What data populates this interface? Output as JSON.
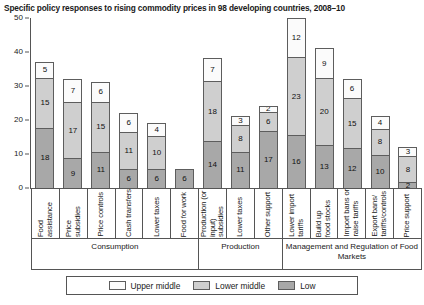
{
  "chart_data": {
    "type": "bar",
    "stacked": true,
    "title": "Specific policy responses to rising commodity prices in 98 developing countries, 2008–10",
    "xlabel": "",
    "ylabel": "",
    "ylim": [
      0,
      50
    ],
    "yticks": [
      0,
      10,
      20,
      30,
      40,
      50
    ],
    "grid": false,
    "legend_position": "bottom",
    "categories": [
      "Food assistance",
      "Price subsidies",
      "Price controls",
      "Cash transfers",
      "Lower taxes",
      "Food for work",
      "Production (or\ninput) subsidies",
      "Lower taxes",
      "Other support",
      "Lower import\ntariffs",
      "Build up\nfood stocks",
      "Import bans or\nraise tariffs",
      "Export bans/\ntariffs/controls",
      "Price support"
    ],
    "series": [
      {
        "name": "Low",
        "color": "#a8a8a8",
        "values": [
          18,
          9,
          11,
          6,
          6,
          6,
          14,
          11,
          17,
          16,
          13,
          12,
          10,
          2
        ]
      },
      {
        "name": "Lower middle",
        "color": "#cfcfcf",
        "values": [
          15,
          17,
          15,
          11,
          10,
          0,
          18,
          8,
          6,
          23,
          20,
          15,
          8,
          8
        ]
      },
      {
        "name": "Upper middle",
        "color": "#fbfbfb",
        "values": [
          5,
          7,
          6,
          6,
          4,
          0,
          7,
          3,
          2,
          12,
          9,
          6,
          4,
          3
        ]
      }
    ],
    "totals": [
      38,
      33,
      32,
      23,
      20,
      6,
      39,
      22,
      25,
      51,
      42,
      33,
      22,
      13
    ],
    "groups": [
      {
        "label": "Consumption",
        "span": 6
      },
      {
        "label": "Production",
        "span": 3
      },
      {
        "label": "Management and Regulation\nof Food Markets",
        "span": 5
      }
    ],
    "legend": [
      {
        "label": "Upper middle",
        "key": "upper"
      },
      {
        "label": "Lower middle",
        "key": "lower"
      },
      {
        "label": "Low",
        "key": "low"
      }
    ]
  }
}
